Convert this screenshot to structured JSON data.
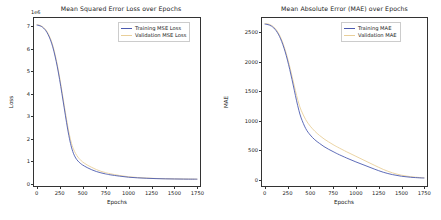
{
  "figure": {
    "background": "#ffffff",
    "width": 441,
    "height": 220
  },
  "colors": {
    "training": "#4c5bb0",
    "validation": "#e9cf9a",
    "axis": "#333333",
    "text": "#1a1a1a"
  },
  "charts": [
    {
      "id": "mse-loss-chart",
      "title": "Mean Squared Error Loss over Epochs",
      "offset_text": "1e6",
      "xlabel": "Epochs",
      "ylabel": "Loss",
      "xticks": [
        "0",
        "250",
        "500",
        "750",
        "1000",
        "1250",
        "1500",
        "1750"
      ],
      "yticks": [
        "0",
        "1",
        "2",
        "3",
        "4",
        "5",
        "6",
        "7"
      ],
      "legend": [
        {
          "label": "Training MSE Loss",
          "color": "#4c5bb0"
        },
        {
          "label": "Validation MSE Loss",
          "color": "#e9cf9a"
        }
      ]
    },
    {
      "id": "mae-chart",
      "title": "Mean Absolute Error (MAE) over Epochs",
      "offset_text": "",
      "xlabel": "Epochs",
      "ylabel": "MAE",
      "xticks": [
        "0",
        "250",
        "500",
        "750",
        "1000",
        "1250",
        "1500",
        "1750"
      ],
      "yticks": [
        "0",
        "500",
        "1000",
        "1500",
        "2000",
        "2500"
      ],
      "legend": [
        {
          "label": "Training MAE",
          "color": "#4c5bb0"
        },
        {
          "label": "Validation MAE",
          "color": "#e9cf9a"
        }
      ]
    }
  ],
  "chart_data": [
    {
      "type": "line",
      "title": "Mean Squared Error Loss over Epochs",
      "xlabel": "Epochs",
      "ylabel": "Loss",
      "y_offset_multiplier": "1e6",
      "xlim": [
        -40,
        1790
      ],
      "ylim": [
        -0.35,
        7.45
      ],
      "grid": false,
      "legend_position": "upper right",
      "x": [
        0,
        25,
        50,
        75,
        100,
        125,
        150,
        175,
        200,
        225,
        250,
        275,
        300,
        325,
        350,
        375,
        400,
        425,
        450,
        475,
        500,
        550,
        600,
        650,
        700,
        750,
        800,
        900,
        1000,
        1100,
        1200,
        1300,
        1400,
        1500,
        1600,
        1700,
        1750
      ],
      "series": [
        {
          "name": "Training MSE Loss",
          "color": "#4c5bb0",
          "values": [
            7.08,
            7.06,
            7.02,
            6.94,
            6.82,
            6.64,
            6.4,
            6.08,
            5.66,
            5.16,
            4.58,
            3.94,
            3.28,
            2.62,
            2.02,
            1.54,
            1.2,
            0.98,
            0.84,
            0.74,
            0.66,
            0.54,
            0.44,
            0.36,
            0.3,
            0.25,
            0.21,
            0.15,
            0.1,
            0.07,
            0.05,
            0.035,
            0.025,
            0.018,
            0.013,
            0.01,
            0.009
          ]
        },
        {
          "name": "Validation MSE Loss",
          "color": "#e9cf9a",
          "values": [
            7.1,
            7.08,
            7.04,
            6.97,
            6.86,
            6.69,
            6.46,
            6.15,
            5.74,
            5.25,
            4.68,
            4.05,
            3.4,
            2.76,
            2.18,
            1.72,
            1.4,
            1.18,
            1.02,
            0.9,
            0.8,
            0.66,
            0.55,
            0.45,
            0.37,
            0.31,
            0.26,
            0.18,
            0.12,
            0.085,
            0.06,
            0.042,
            0.03,
            0.022,
            0.016,
            0.012,
            0.011
          ]
        }
      ]
    },
    {
      "type": "line",
      "title": "Mean Absolute Error (MAE) over Epochs",
      "xlabel": "Epochs",
      "ylabel": "MAE",
      "xlim": [
        -40,
        1790
      ],
      "ylim": [
        -120,
        2760
      ],
      "grid": false,
      "legend_position": "upper right",
      "x": [
        0,
        25,
        50,
        75,
        100,
        125,
        150,
        175,
        200,
        225,
        250,
        275,
        300,
        325,
        350,
        375,
        400,
        450,
        500,
        550,
        600,
        650,
        700,
        750,
        800,
        900,
        1000,
        1100,
        1200,
        1300,
        1400,
        1500,
        1600,
        1700,
        1750
      ],
      "series": [
        {
          "name": "Training MAE",
          "color": "#4c5bb0",
          "values": [
            2640,
            2635,
            2625,
            2605,
            2575,
            2530,
            2470,
            2390,
            2290,
            2170,
            2030,
            1870,
            1700,
            1520,
            1340,
            1180,
            1050,
            870,
            760,
            680,
            620,
            565,
            520,
            480,
            440,
            370,
            305,
            245,
            185,
            130,
            90,
            62,
            45,
            35,
            32
          ]
        },
        {
          "name": "Validation MAE",
          "color": "#e9cf9a",
          "values": [
            2650,
            2646,
            2637,
            2618,
            2590,
            2548,
            2490,
            2414,
            2318,
            2202,
            2068,
            1916,
            1756,
            1592,
            1432,
            1290,
            1180,
            1020,
            910,
            825,
            755,
            695,
            645,
            598,
            555,
            475,
            400,
            325,
            250,
            178,
            120,
            80,
            55,
            40,
            36
          ]
        }
      ]
    }
  ]
}
